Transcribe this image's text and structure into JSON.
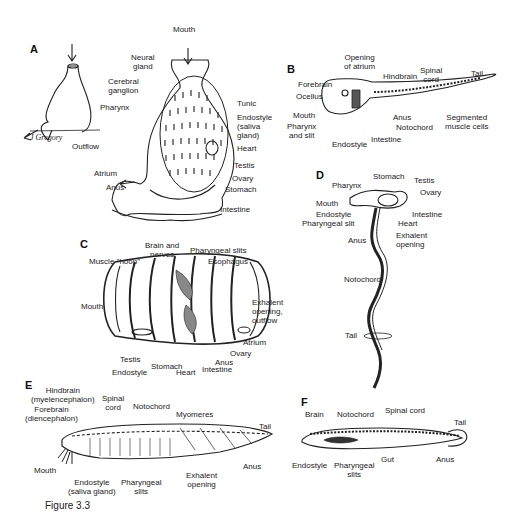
{
  "figure": {
    "caption": "Figure 3.3",
    "signature": "J Gregory"
  },
  "panels": {
    "A": {
      "letter": "A",
      "labels": {
        "mouth": "Mouth",
        "neural_gland": "Neural\ngland",
        "cerebral_ganglion": "Cerebral\nganglion",
        "pharynx": "Pharynx",
        "tunic": "Tunic",
        "endostyle": "Endostyle\n(saliva\ngland)",
        "heart": "Heart",
        "outflow": "Outflow",
        "testis": "Testis",
        "atrium": "Atrium",
        "ovary": "Ovary",
        "anus": "Anus",
        "stomach": "Stomach",
        "intestine": "Intestine"
      }
    },
    "B": {
      "letter": "B",
      "labels": {
        "opening_of_atrium": "Opening\nof atrium",
        "forebrain": "Forebrain",
        "hindbrain": "Hindbrain",
        "spinal_cord": "Spinal\ncord",
        "tail": "Tail",
        "ocellus": "Ocellus",
        "mouth": "Mouth",
        "pharynx_and_slit": "Pharynx\nand slit",
        "anus": "Anus",
        "notochord": "Notochord",
        "segmented_muscle_cells": "Segmented\nmuscle cells",
        "endostyle": "Endostyle",
        "intestine": "Intestine"
      }
    },
    "C": {
      "letter": "C",
      "labels": {
        "brain_and_nerves": "Brain and\nnerves",
        "pharyngeal_slits": "Pharyngeal slits",
        "muscle_hoop": "Muscle \"hoop\"",
        "esophagus": "Esophagus",
        "mouth": "Mouth",
        "exhalent_opening": "Exhalent\nopening,\noutflow",
        "atrium": "Atrium",
        "ovary": "Ovary",
        "testis": "Testis",
        "anus": "Anus",
        "stomach": "Stomach",
        "endostyle": "Endostyle",
        "heart": "Heart",
        "intestine": "Intestine"
      }
    },
    "D": {
      "letter": "D",
      "labels": {
        "stomach": "Stomach",
        "testis": "Testis",
        "pharynx": "Pharynx",
        "ovary": "Ovary",
        "mouth": "Mouth",
        "intestine": "Intestine",
        "endostyle": "Endostyle",
        "heart": "Heart",
        "pharyngeal_slit": "Pharyngeal slit",
        "exhalent_opening": "Exhalent\nopening",
        "anus": "Anus",
        "notochord": "Notochord",
        "tail": "Tail"
      }
    },
    "E": {
      "letter": "E",
      "labels": {
        "hindbrain": "Hindbrain\n(myelencephalon)",
        "spinal_cord": "Spinal\ncord",
        "notochord": "Notochord",
        "forebrain": "Forebrain\n(diencephalon)",
        "myomeres": "Myomeres",
        "tail": "Tail",
        "mouth": "Mouth",
        "anus": "Anus",
        "exhalent_opening": "Exhalent\nopening",
        "endostyle": "Endostyle\n(saliva gland)",
        "pharyngeal_slits": "Pharyngeal\nslits"
      }
    },
    "F": {
      "letter": "F",
      "labels": {
        "brain": "Brain",
        "notochord": "Notochord",
        "spinal_cord": "Spinal cord",
        "tail": "Tail",
        "gut": "Gut",
        "anus": "Anus",
        "endostyle": "Endostyle",
        "pharyngeal_slits": "Pharyngeal\nslits"
      }
    }
  }
}
